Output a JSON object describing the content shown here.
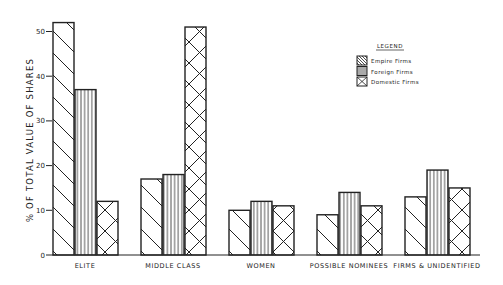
{
  "chart_data": {
    "type": "bar",
    "title": "",
    "xlabel": "",
    "ylabel": "% OF TOTAL VALUE OF SHARES",
    "ylim": [
      0,
      52
    ],
    "yticks": [
      0,
      10,
      20,
      30,
      40,
      50
    ],
    "grid": false,
    "legend_position": "upper right",
    "legend_title": "LEGEND",
    "categories": [
      "ELITE",
      "MIDDLE CLASS",
      "WOMEN",
      "POSSIBLE NOMINEES",
      "FIRMS & UNIDENTIFIED"
    ],
    "series": [
      {
        "name": "Empire Firms",
        "pattern": "diagonal",
        "values": [
          52,
          17,
          10,
          9,
          13
        ]
      },
      {
        "name": "Foreign Firms",
        "pattern": "vertical",
        "values": [
          37,
          18,
          12,
          14,
          19
        ]
      },
      {
        "name": "Domestic Firms",
        "pattern": "crosshatch",
        "values": [
          12,
          51,
          11,
          11,
          15
        ]
      }
    ]
  },
  "colors": {
    "ink": "#222222",
    "background": "#ffffff"
  }
}
